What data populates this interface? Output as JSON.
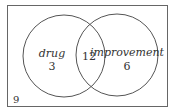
{
  "diagram": {
    "type": "venn",
    "sets": [
      {
        "name": "drug",
        "only_count": "3"
      },
      {
        "name": "improvement",
        "only_count": "6"
      }
    ],
    "intersection_count": "12",
    "outside_count": "9"
  }
}
